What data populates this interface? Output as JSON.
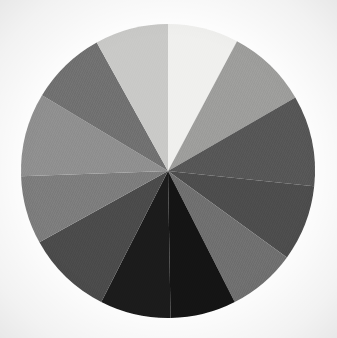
{
  "chart_data": {
    "type": "pie",
    "title": "",
    "subtitle": "",
    "xlabel": "",
    "ylabel": "",
    "grid": false,
    "legend_position": "none",
    "background_color": "#ffffff",
    "center_x": 168,
    "center_y": 171,
    "radius": 147,
    "start_angle_deg": 90,
    "direction": "clockwise",
    "total": 360,
    "categories": [
      "Slice 1",
      "Slice 2",
      "Slice 3",
      "Slice 4",
      "Slice 5",
      "Slice 6",
      "Slice 7",
      "Slice 8",
      "Slice 9",
      "Slice 10",
      "Slice 11",
      "Slice 12"
    ],
    "values": [
      28,
      32,
      36,
      30,
      27,
      26,
      28,
      34,
      27,
      33,
      30,
      29
    ],
    "angles_deg": [
      28,
      32,
      36,
      30,
      27,
      26,
      28,
      34,
      27,
      33,
      30,
      29
    ],
    "colors": [
      "#f0f0ee",
      "#9d9d9b",
      "#565656",
      "#4c4c4c",
      "#6f6f6f",
      "#141414",
      "#1b1b1b",
      "#4a4a4a",
      "#7c7c7c",
      "#8f8f8f",
      "#707070",
      "#c9c9c7"
    ],
    "annotations": [],
    "data_labels_visible": false,
    "tick_labels": []
  }
}
